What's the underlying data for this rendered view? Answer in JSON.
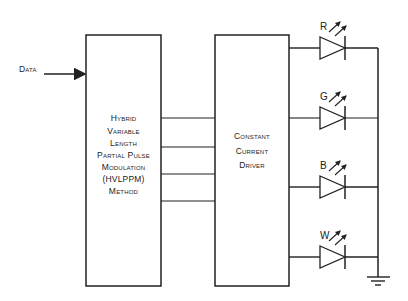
{
  "diagram": {
    "input_label": "Data",
    "blocks": [
      {
        "id": "hvlppm",
        "lines": [
          "Hybrid",
          "Variable",
          "Length",
          "Partial Pulse",
          "Modulation",
          "(HVLPPM)",
          "Method"
        ]
      },
      {
        "id": "driver",
        "lines": [
          "Constant",
          "Current",
          "Driver"
        ]
      }
    ],
    "leds": [
      {
        "label": "R"
      },
      {
        "label": "G"
      },
      {
        "label": "B"
      },
      {
        "label": "W"
      }
    ],
    "ground_symbol": "ground-icon",
    "colors": {
      "stroke": "#222222",
      "background": "#ffffff"
    }
  }
}
